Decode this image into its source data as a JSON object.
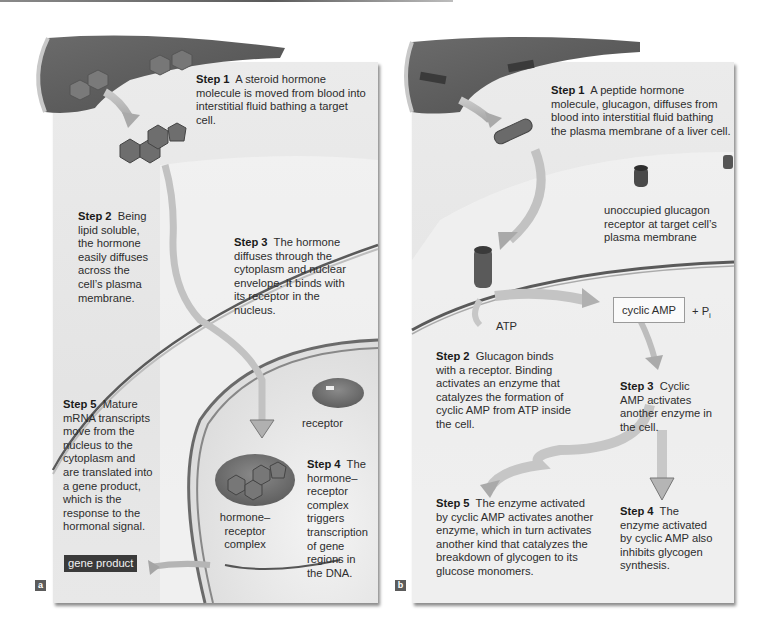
{
  "panels": {
    "a": {
      "label": "a",
      "step1": {
        "title": "Step 1",
        "text": "A steroid hormone molecule is moved from blood into interstitial fluid bathing a target cell."
      },
      "step2": {
        "title": "Step 2",
        "text": "Being lipid soluble, the hormone easily diffuses across the cell’s plasma membrane."
      },
      "step3": {
        "title": "Step 3",
        "text": "The hormone diffuses through the cytoplasm and nuclear envelope. It binds with its receptor in the nucleus."
      },
      "step4": {
        "title": "Step 4",
        "text": "The hormone–receptor complex triggers transcription of gene regions in the DNA."
      },
      "step5": {
        "title": "Step 5",
        "text": "Mature mRNA transcripts move from the nucleus to the cytoplasm and are translated into a gene product, which is the response to the hormonal signal."
      },
      "labels": {
        "receptor": "receptor",
        "complex": "hormone–receptor complex",
        "gene_product": "gene product"
      }
    },
    "b": {
      "label": "b",
      "step1": {
        "title": "Step 1",
        "text": "A peptide hormone molecule, glucagon, diffuses from blood into interstitial fluid bathing the plasma membrane of a liver cell."
      },
      "step2": {
        "title": "Step 2",
        "text": "Glucagon binds with a receptor. Binding activates an enzyme that catalyzes the formation of cyclic AMP from ATP inside the cell."
      },
      "step3": {
        "title": "Step 3",
        "text": "Cyclic AMP activates another enzyme in the cell."
      },
      "step4": {
        "title": "Step 4",
        "text": "The enzyme activated by cyclic AMP also inhibits glycogen synthesis."
      },
      "step5": {
        "title": "Step 5",
        "text": "The enzyme activated by cyclic AMP activates another enzyme, which in turn activates another kind that catalyzes the breakdown of glycogen to its glucose monomers."
      },
      "labels": {
        "unoccupied_receptor": "unoccupied glucagon receptor at target cell’s plasma membrane",
        "atp": "ATP",
        "cyclic_amp": "cyclic AMP",
        "pi": "+ P",
        "pi_sub": "i"
      }
    }
  }
}
